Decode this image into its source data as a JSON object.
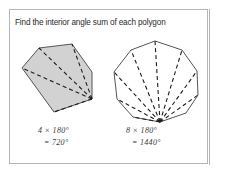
{
  "panel": {
    "border_color": "#b6b6b6",
    "background": "#ffffff"
  },
  "prompt": {
    "text": "Find the interior angle sum of each polygon",
    "color": "#2b2b2b"
  },
  "figures": [
    {
      "id": "hexagon",
      "name": "shaded-hexagon",
      "sides": 6,
      "diagonals": 4,
      "triangles": 4,
      "fill": "#d2d2d2",
      "stroke": "#555555",
      "dash_color": "#1d1d1d",
      "vertices": [
        [
          22,
          68
        ],
        [
          39,
          48
        ],
        [
          72,
          44
        ],
        [
          92,
          72
        ],
        [
          92,
          99
        ],
        [
          54,
          112
        ]
      ],
      "fan_vertex": [
        92,
        99
      ],
      "diagonal_targets": [
        [
          22,
          68
        ],
        [
          39,
          48
        ],
        [
          72,
          44
        ],
        [
          54,
          112
        ]
      ],
      "label_line1": "4 × 180°",
      "label_line2": "= 720°"
    },
    {
      "id": "decagon",
      "name": "outlined-decagon",
      "sides": 10,
      "diagonals": 8,
      "triangles": 8,
      "fill": "#ffffff",
      "stroke": "#555555",
      "dash_color": "#1d1d1d",
      "vertices": [
        [
          155,
          41
        ],
        [
          182,
          50
        ],
        [
          197,
          71
        ],
        [
          198,
          95
        ],
        [
          186,
          113
        ],
        [
          160,
          122
        ],
        [
          133,
          117
        ],
        [
          117,
          99
        ],
        [
          114,
          72
        ],
        [
          131,
          50
        ]
      ],
      "fan_vertex": [
        160,
        122
      ],
      "diagonal_targets": [
        [
          133,
          117
        ],
        [
          117,
          99
        ],
        [
          114,
          72
        ],
        [
          131,
          50
        ],
        [
          155,
          41
        ],
        [
          182,
          50
        ],
        [
          197,
          71
        ],
        [
          198,
          95
        ]
      ],
      "label_line1": "8 × 180°",
      "label_line2": "= 1440°"
    }
  ]
}
